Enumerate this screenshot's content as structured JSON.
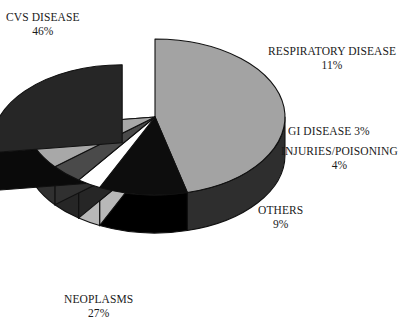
{
  "chart_data": {
    "type": "pie",
    "title": "",
    "subtitle": "",
    "xlabel": "",
    "ylabel": "",
    "legend_position": "callout-labels",
    "grid": false,
    "units": "percent",
    "total": 100,
    "start_angle_deg": 0,
    "direction": "clockwise",
    "three_d": true,
    "categories": [
      "CVS DISEASE",
      "RESPIRATORY DISEASE",
      "GI DISEASE",
      "INJURIES/POISONING",
      "OTHERS",
      "NEOPLASMS"
    ],
    "values": [
      46,
      11,
      3,
      4,
      9,
      27
    ],
    "slices": [
      {
        "label": "CVS DISEASE",
        "value": 46,
        "pct_text": "46%",
        "color": "#a3a3a3",
        "side_color": "#2e2e2e",
        "exploded": false
      },
      {
        "label": "RESPIRATORY DISEASE",
        "value": 11,
        "pct_text": "11%",
        "color": "#0d0d0d",
        "side_color": "#000000",
        "exploded": false
      },
      {
        "label": "GI DISEASE",
        "value": 3,
        "pct_text": "3%",
        "color": "#ffffff",
        "side_color": "#b8b8b8",
        "exploded": false
      },
      {
        "label": "INJURIES/POISONING",
        "value": 4,
        "pct_text": "4%",
        "color": "#4a4a4a",
        "side_color": "#262626",
        "exploded": false
      },
      {
        "label": "OTHERS",
        "value": 9,
        "pct_text": "9%",
        "color": "#a8a8a8",
        "side_color": "#303030",
        "exploded": false
      },
      {
        "label": "NEOPLASMS",
        "value": 27,
        "pct_text": "27%",
        "color": "#262626",
        "side_color": "#0a0a0a",
        "exploded": true
      }
    ]
  },
  "labels": {
    "cvs": {
      "name": "CVS DISEASE",
      "pct": "46%"
    },
    "respiratory": {
      "name": "RESPIRATORY DISEASE",
      "pct": "11%"
    },
    "gi": {
      "name_with_pct": "GI DISEASE 3%"
    },
    "injuries": {
      "name": "INJURIES/POISONING",
      "pct": "4%"
    },
    "others": {
      "name": "OTHERS",
      "pct": "9%"
    },
    "neoplasms": {
      "name": "NEOPLASMS",
      "pct": "27%"
    }
  }
}
